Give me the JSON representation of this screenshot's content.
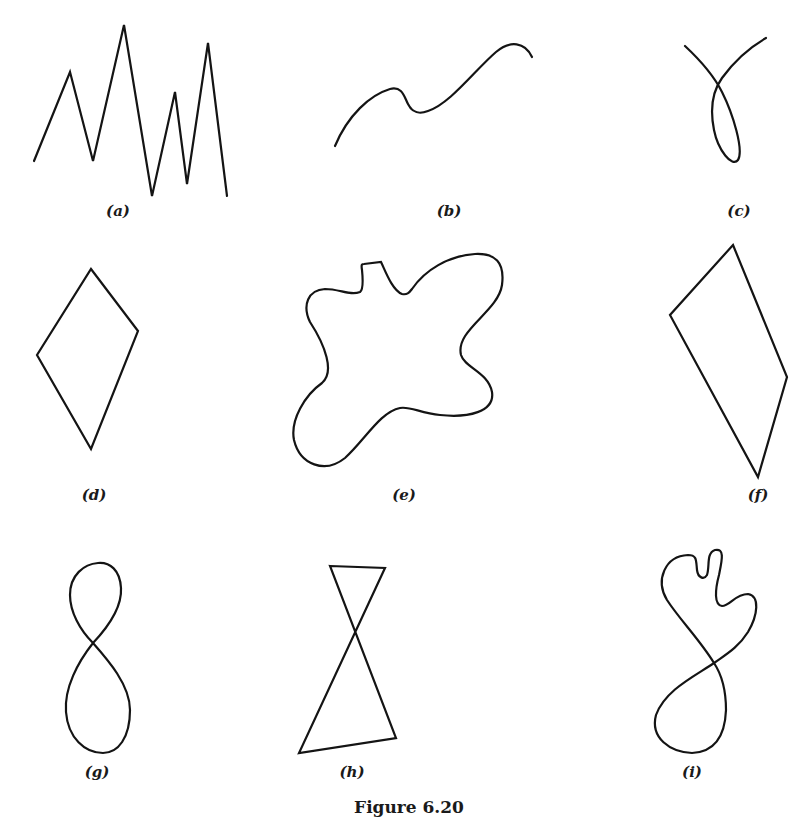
{
  "figure": {
    "caption": "Figure 6.20",
    "panels": [
      {
        "id": "a",
        "label": "(a)",
        "shape": "zigzag open polyline"
      },
      {
        "id": "b",
        "label": "(b)",
        "shape": "wavy open curve"
      },
      {
        "id": "c",
        "label": "(c)",
        "shape": "open curve with self-intersecting loop"
      },
      {
        "id": "d",
        "label": "(d)",
        "shape": "diamond (simple closed polygon)"
      },
      {
        "id": "e",
        "label": "(e)",
        "shape": "irregular blob (simple closed curve)"
      },
      {
        "id": "f",
        "label": "(f)",
        "shape": "quadrilateral (simple closed polygon)"
      },
      {
        "id": "g",
        "label": "(g)",
        "shape": "figure-eight (closed, self-intersecting)"
      },
      {
        "id": "h",
        "label": "(h)",
        "shape": "bowtie (closed, self-intersecting polygon)"
      },
      {
        "id": "i",
        "label": "(i)",
        "shape": "closed self-intersecting curve"
      }
    ],
    "stroke_color": "#141414",
    "background": "#ffffff"
  }
}
